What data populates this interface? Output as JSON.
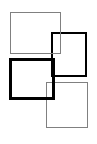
{
  "diagram": {
    "canvas": {
      "width": 97,
      "height": 144,
      "background": "#ffffff"
    },
    "boxes": [
      {
        "id": "box-1",
        "x": 10,
        "y": 12,
        "w": 51,
        "h": 42,
        "stroke": "#808080",
        "stroke_width": 1.5,
        "z": 1
      },
      {
        "id": "box-2",
        "x": 51,
        "y": 32,
        "w": 36,
        "h": 45,
        "stroke": "#000000",
        "stroke_width": 2,
        "z": 0
      },
      {
        "id": "box-3",
        "x": 9,
        "y": 58,
        "w": 46,
        "h": 42,
        "stroke": "#000000",
        "stroke_width": 3,
        "z": 2
      },
      {
        "id": "box-4",
        "x": 46,
        "y": 82,
        "w": 42,
        "h": 46,
        "stroke": "#808080",
        "stroke_width": 1.5,
        "z": 0
      }
    ]
  }
}
